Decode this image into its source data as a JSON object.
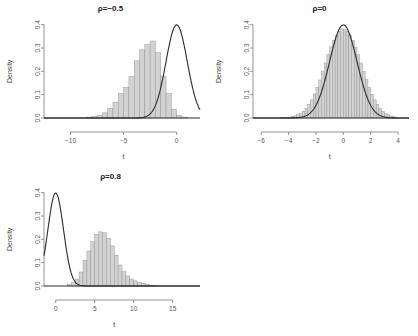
{
  "figure": {
    "background": "#ffffff",
    "bar_fill": "#d2d2d2",
    "bar_stroke": "#8c8c8c",
    "curve_color": "#2b2b2b",
    "axis_color": "#7a7a7a",
    "width": 418,
    "height": 336
  },
  "chart_data": [
    {
      "type": "bar",
      "id": "panel-rho-neg05",
      "title": "ρ=−0.5",
      "xlabel": "t",
      "ylabel": "Density",
      "xlim": [
        -12.5,
        2.2
      ],
      "ylim": [
        0.0,
        0.42
      ],
      "xticks": [
        -10,
        -5,
        0
      ],
      "xticklabels": [
        "−10",
        "−5",
        "0"
      ],
      "yticks": [
        0.0,
        0.1,
        0.2,
        0.3,
        0.4
      ],
      "yticklabels": [
        "0.0",
        "0.1",
        "0.2",
        "0.3",
        "0.4"
      ],
      "grid": false,
      "legend": "none",
      "bin_width": 0.5,
      "bin_left_edges": [
        -8.5,
        -8.0,
        -7.5,
        -7.0,
        -6.5,
        -6.0,
        -5.5,
        -5.0,
        -4.5,
        -4.0,
        -3.5,
        -3.0,
        -2.5,
        -2.0,
        -1.5,
        -1.0,
        -0.5,
        0.0,
        0.5
      ],
      "values": [
        0.004,
        0.006,
        0.012,
        0.022,
        0.042,
        0.068,
        0.105,
        0.132,
        0.178,
        0.245,
        0.292,
        0.315,
        0.33,
        0.28,
        0.18,
        0.105,
        0.038,
        0.012,
        0.004
      ],
      "overlay": {
        "name": "standard normal density",
        "type": "line",
        "distribution": "normal",
        "mean": 0,
        "sd": 1,
        "peak": 0.399
      }
    },
    {
      "type": "bar",
      "id": "panel-rho-0",
      "title": "ρ=0",
      "xlabel": "t",
      "ylabel": "Density",
      "xlim": [
        -6.6,
        4.8
      ],
      "ylim": [
        0.0,
        0.42
      ],
      "xticks": [
        -6,
        -4,
        -2,
        0,
        2,
        4
      ],
      "xticklabels": [
        "−6",
        "−4",
        "−2",
        "0",
        "2",
        "4"
      ],
      "yticks": [
        0.0,
        0.1,
        0.2,
        0.3,
        0.4
      ],
      "yticklabels": [
        "0.0",
        "0.1",
        "0.2",
        "0.3",
        "0.4"
      ],
      "grid": false,
      "legend": "none",
      "bin_width": 0.2,
      "bin_left_edges": [
        -4.6,
        -4.4,
        -4.2,
        -4.0,
        -3.8,
        -3.6,
        -3.4,
        -3.2,
        -3.0,
        -2.8,
        -2.6,
        -2.4,
        -2.2,
        -2.0,
        -1.8,
        -1.6,
        -1.4,
        -1.2,
        -1.0,
        -0.8,
        -0.6,
        -0.4,
        -0.2,
        0.0,
        0.2,
        0.4,
        0.6,
        0.8,
        1.0,
        1.2,
        1.4,
        1.6,
        1.8,
        2.0,
        2.2,
        2.4,
        2.6,
        2.8,
        3.0,
        3.2,
        3.4,
        3.6,
        3.8
      ],
      "values": [
        0.001,
        0.002,
        0.003,
        0.004,
        0.006,
        0.009,
        0.014,
        0.02,
        0.029,
        0.042,
        0.058,
        0.078,
        0.103,
        0.131,
        0.163,
        0.199,
        0.236,
        0.272,
        0.305,
        0.333,
        0.355,
        0.372,
        0.382,
        0.38,
        0.372,
        0.356,
        0.333,
        0.304,
        0.271,
        0.236,
        0.2,
        0.164,
        0.131,
        0.102,
        0.078,
        0.057,
        0.041,
        0.029,
        0.02,
        0.013,
        0.009,
        0.005,
        0.003
      ],
      "overlay": {
        "name": "standard normal density",
        "type": "line",
        "distribution": "normal",
        "mean": 0,
        "sd": 1,
        "peak": 0.399
      }
    },
    {
      "type": "bar",
      "id": "panel-rho-08",
      "title": "ρ=0.8",
      "xlabel": "t",
      "ylabel": "Density",
      "xlim": [
        -1.5,
        18.5
      ],
      "ylim": [
        0.0,
        0.42
      ],
      "xticks": [
        0,
        5,
        10,
        15
      ],
      "xticklabels": [
        "0",
        "5",
        "10",
        "15"
      ],
      "yticks": [
        0.0,
        0.1,
        0.2,
        0.3,
        0.4
      ],
      "yticklabels": [
        "0.0",
        "0.1",
        "0.2",
        "0.3",
        "0.4"
      ],
      "grid": false,
      "legend": "none",
      "bin_width": 0.5,
      "bin_left_edges": [
        1.5,
        2.0,
        2.5,
        3.0,
        3.5,
        4.0,
        4.5,
        5.0,
        5.5,
        6.0,
        6.5,
        7.0,
        7.5,
        8.0,
        8.5,
        9.0,
        9.5,
        10.0,
        10.5,
        11.0,
        11.5,
        12.0,
        12.5
      ],
      "values": [
        0.006,
        0.014,
        0.03,
        0.06,
        0.11,
        0.15,
        0.19,
        0.222,
        0.232,
        0.228,
        0.205,
        0.172,
        0.132,
        0.09,
        0.062,
        0.043,
        0.03,
        0.022,
        0.016,
        0.011,
        0.007,
        0.004,
        0.002
      ],
      "overlay": {
        "name": "standard normal density",
        "type": "line",
        "distribution": "normal",
        "mean": 0,
        "sd": 1,
        "peak": 0.399
      }
    }
  ]
}
